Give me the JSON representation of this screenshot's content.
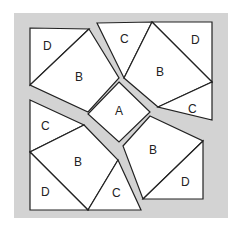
{
  "diagram": {
    "frame_color": "#d3d3d3",
    "piece_fill": "#ffffff",
    "line_color": "#222222",
    "labels": {
      "a_center": "A",
      "tl_d": "D",
      "tl_b": "B",
      "tr_c": "C",
      "tr_d": "D",
      "tr_b": "B",
      "tr_c2": "C",
      "bl_c": "C",
      "bl_b": "B",
      "bl_d": "D",
      "bl_c2": "C",
      "br_b": "B",
      "br_d": "D"
    }
  }
}
